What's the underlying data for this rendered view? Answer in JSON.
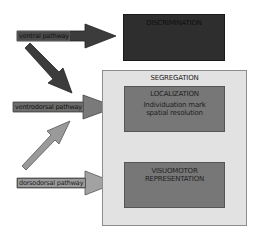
{
  "diagram": {
    "boxes": {
      "discrimination": {
        "title": "DISCRIMINATION"
      },
      "segregation": {
        "title": "SEGREGATION"
      },
      "localization": {
        "title": "LOCALIZATION",
        "lines": [
          "Individuation mark",
          "spatial resolution"
        ]
      },
      "visuomotor": {
        "lines": [
          "VISUOMOTOR",
          "REPRESENTATION"
        ]
      }
    },
    "pathways": {
      "ventral": "ventral pathway",
      "ventrodorsal": "ventrodorsal pathway",
      "dorsodorsal": "dorsodorsal pathway"
    },
    "colors": {
      "ventral_arrow": "#3c3c3c",
      "ventrodorsal_arrow": "#6a6a6a",
      "dorsodorsal_arrow": "#9a9a9a",
      "discrimination_box": "#2e2e2e",
      "inner_box": "#777777",
      "segregation_box": "#e2e2e2"
    }
  }
}
